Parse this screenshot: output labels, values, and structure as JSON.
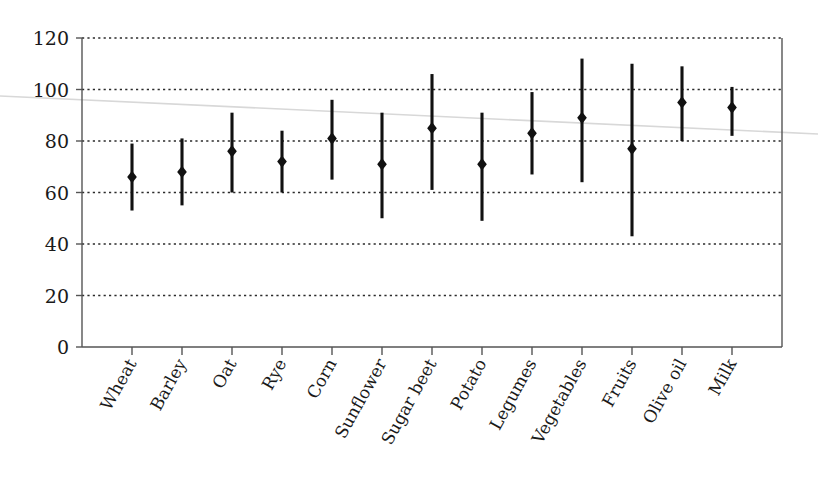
{
  "chart_data": {
    "type": "scatter",
    "title": "",
    "subtitle": "",
    "xlabel": "",
    "ylabel": "",
    "ylim": [
      0,
      120
    ],
    "ytick_values": [
      0,
      20,
      40,
      60,
      80,
      100,
      120
    ],
    "ytick_labels": [
      "0",
      "20",
      "40",
      "60",
      "80",
      "100",
      "120"
    ],
    "grid": "horizontal-dotted",
    "legend": "none",
    "marker": "filled-diamond",
    "errorbar": "vertical-range-line",
    "categories": [
      "Wheat",
      "Barley",
      "Oat",
      "Rye",
      "Corn",
      "Sunflower",
      "Sugar beet",
      "Potato",
      "Legumes",
      "Vegetables",
      "Fruits",
      "Olive oil",
      "Milk"
    ],
    "values": [
      66,
      68,
      76,
      72,
      81,
      71,
      85,
      71,
      83,
      89,
      77,
      95,
      93
    ],
    "low": [
      53,
      55,
      60,
      60,
      65,
      50,
      61,
      49,
      67,
      64,
      43,
      80,
      82
    ],
    "high": [
      79,
      81,
      91,
      84,
      96,
      91,
      106,
      91,
      99,
      112,
      110,
      109,
      101
    ],
    "series": [
      {
        "name": "value",
        "points": [
          {
            "category": "Wheat",
            "value": 66,
            "low": 53,
            "high": 79
          },
          {
            "category": "Barley",
            "value": 68,
            "low": 55,
            "high": 81
          },
          {
            "category": "Oat",
            "value": 76,
            "low": 60,
            "high": 91
          },
          {
            "category": "Rye",
            "value": 72,
            "low": 60,
            "high": 84
          },
          {
            "category": "Corn",
            "value": 81,
            "low": 65,
            "high": 96
          },
          {
            "category": "Sunflower",
            "value": 71,
            "low": 50,
            "high": 91
          },
          {
            "category": "Sugar beet",
            "value": 85,
            "low": 61,
            "high": 106
          },
          {
            "category": "Potato",
            "value": 71,
            "low": 49,
            "high": 91
          },
          {
            "category": "Legumes",
            "value": 83,
            "low": 67,
            "high": 99
          },
          {
            "category": "Vegetables",
            "value": 89,
            "low": 64,
            "high": 112
          },
          {
            "category": "Fruits",
            "value": 77,
            "low": 43,
            "high": 110
          },
          {
            "category": "Olive oil",
            "value": 95,
            "low": 80,
            "high": 109
          },
          {
            "category": "Milk",
            "value": 93,
            "low": 82,
            "high": 101
          }
        ]
      }
    ],
    "colors": {
      "marker": "#111111",
      "errorbar": "#111111",
      "grid": "#2b2b2b",
      "axis": "#555555",
      "background": "#ffffff",
      "artifact": "#d8d8d8"
    }
  }
}
